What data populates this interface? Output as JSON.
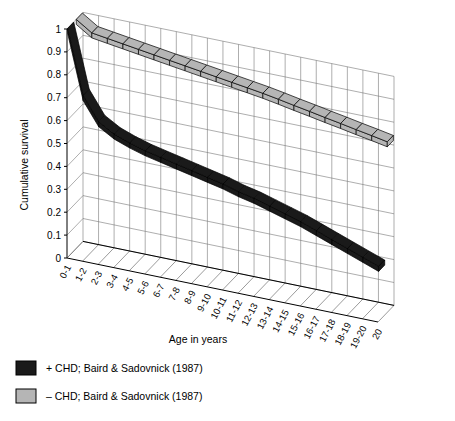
{
  "chart_data": {
    "type": "line",
    "title": "",
    "subtitle": "",
    "xlabel": "Age in years",
    "ylabel": "Cumulative survival",
    "ylim": [
      0,
      1
    ],
    "ytick_labels": [
      "0",
      "0.1",
      "0.2",
      "0.3",
      "0.4",
      "0.5",
      "0.6",
      "0.7",
      "0.8",
      "0.9",
      "1"
    ],
    "ytick_values": [
      0,
      0.1,
      0.2,
      0.3,
      0.4,
      0.5,
      0.6,
      0.7,
      0.8,
      0.9,
      1
    ],
    "grid": true,
    "projection": "3d-ribbon",
    "legend_position": "below-left",
    "categories": [
      "0-1",
      "1-2",
      "2-3",
      "3-4",
      "4-5",
      "5-6",
      "6-7",
      "7-8",
      "8-9",
      "9-10",
      "10-11",
      "11-12",
      "12-13",
      "13-14",
      "14-15",
      "15-16",
      "16-17",
      "17-18",
      "18-19",
      "19-20",
      "20"
    ],
    "series": [
      {
        "name": "+ CHD; Baird & Sadovnick (1987)",
        "color": "#1a1a1a",
        "values": [
          1.0,
          0.72,
          0.62,
          0.58,
          0.555,
          0.535,
          0.52,
          0.505,
          0.49,
          0.475,
          0.46,
          0.44,
          0.425,
          0.405,
          0.385,
          0.365,
          0.34,
          0.315,
          0.29,
          0.265,
          0.24
        ]
      },
      {
        "name": "– CHD; Baird & Sadovnick (1987)",
        "color": "#b5b5b5",
        "values": [
          1.0,
          0.955,
          0.945,
          0.935,
          0.925,
          0.915,
          0.905,
          0.895,
          0.885,
          0.875,
          0.865,
          0.855,
          0.845,
          0.833,
          0.82,
          0.808,
          0.795,
          0.783,
          0.77,
          0.758,
          0.745
        ]
      }
    ]
  },
  "legend": {
    "items": [
      {
        "label": "+ CHD; Baird & Sadovnick (1987)",
        "color": "#1a1a1a"
      },
      {
        "label": "– CHD; Baird & Sadovnick (1987)",
        "color": "#b5b5b5"
      }
    ]
  },
  "colors": {
    "series_positive": "#1a1a1a",
    "series_negative": "#b5b5b5",
    "grid": "#777777",
    "axis": "#000000",
    "background": "#ffffff"
  }
}
